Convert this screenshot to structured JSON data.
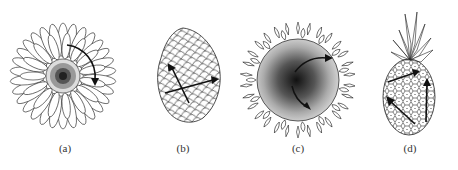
{
  "figure": {
    "panels": [
      {
        "id": "a",
        "label": "(a)",
        "subject": "daisy-flower-head",
        "arrows": 1
      },
      {
        "id": "b",
        "label": "(b)",
        "subject": "pine-cone",
        "arrows": 2
      },
      {
        "id": "c",
        "label": "(c)",
        "subject": "sunflower-head",
        "arrows": 2
      },
      {
        "id": "d",
        "label": "(d)",
        "subject": "pineapple",
        "arrows": 3
      }
    ],
    "colors": {
      "ink": "#1a1a1a",
      "background": "#ffffff",
      "label": "#333333"
    }
  }
}
